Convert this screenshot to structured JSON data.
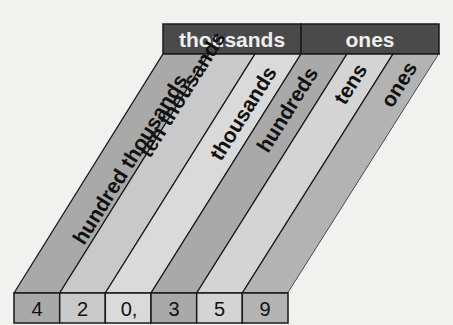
{
  "diagram": {
    "groups": [
      {
        "label": "thousands",
        "color": "#4a4a4a"
      },
      {
        "label": "ones",
        "color": "#4a4a4a"
      }
    ],
    "places": [
      {
        "label": "hundred thousands",
        "digit": "4",
        "color": "#a9a9a9"
      },
      {
        "label": "ten thousands",
        "digit": "2",
        "color": "#c9c9c9"
      },
      {
        "label": "thousands",
        "digit": "0,",
        "color": "#dadada"
      },
      {
        "label": "hundreds",
        "digit": "3",
        "color": "#a9a9a9"
      },
      {
        "label": "tens",
        "digit": "5",
        "color": "#d4d4d4"
      },
      {
        "label": "ones",
        "digit": "9",
        "color": "#b3b3b3"
      }
    ],
    "number": "420,359"
  }
}
